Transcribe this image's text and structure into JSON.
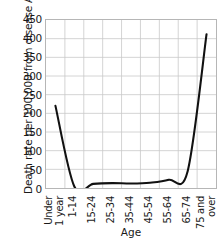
{
  "chart_data": {
    "type": "line",
    "title": "",
    "xlabel": "Age",
    "ylabel": "Death rate per 100,000 from disease A",
    "categories": [
      "Under 1 year",
      "1-14",
      "15-24",
      "25-34",
      "35-44",
      "45-54",
      "55-64",
      "65-74",
      "75 and over"
    ],
    "values": [
      220,
      4,
      11,
      13,
      12,
      14,
      22,
      45,
      412
    ],
    "series": [
      {
        "name": "Death rate from disease A",
        "values": [
          220,
          4,
          11,
          13,
          12,
          14,
          22,
          45,
          412
        ]
      }
    ],
    "ylim": [
      0,
      450
    ],
    "ytick_values": [
      0,
      50,
      100,
      150,
      200,
      250,
      300,
      350,
      400,
      450
    ],
    "ytick_labels": [
      "0",
      "50",
      "100",
      "150",
      "200",
      "250",
      "300",
      "350",
      "400",
      "450"
    ],
    "grid": true,
    "legend": "none",
    "line_color": "#111111",
    "grid_color": "#c9c9c9",
    "axis_color": "#b6b6b6"
  },
  "axes": {
    "y_title": "Death rate per 100,000 from disease A",
    "x_title": "Age"
  },
  "x_tick_labels": [
    {
      "lines": [
        "Under",
        "1 year"
      ]
    },
    {
      "lines": [
        "1-14"
      ]
    },
    {
      "lines": [
        "15-24"
      ]
    },
    {
      "lines": [
        "25-34"
      ]
    },
    {
      "lines": [
        "35-44"
      ]
    },
    {
      "lines": [
        "45-54"
      ]
    },
    {
      "lines": [
        "55-64"
      ]
    },
    {
      "lines": [
        "65-74"
      ]
    },
    {
      "lines": [
        "75 and",
        "over"
      ]
    }
  ]
}
